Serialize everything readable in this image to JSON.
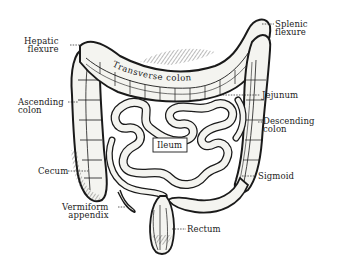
{
  "diagram": {
    "style": "black-and-white engraving",
    "colors": {
      "ink": "#1a1a1a",
      "background": "#ffffff",
      "fill": "#f4f4f0"
    },
    "labels": {
      "hepatic_flexure": "Hepatic\nflexure",
      "splenic_flexure": "Splenic\nflexure",
      "transverse_colon": "Transverse colon",
      "ascending_colon": "Ascending\ncolon",
      "jejunum": "Jejunum",
      "descending_colon": "Descending\ncolon",
      "ileum": "Ileum",
      "cecum": "Cecum",
      "sigmoid": "Sigmoid",
      "vermiform_appendix": "Vermiform\nappendix",
      "rectum": "Rectum"
    }
  }
}
